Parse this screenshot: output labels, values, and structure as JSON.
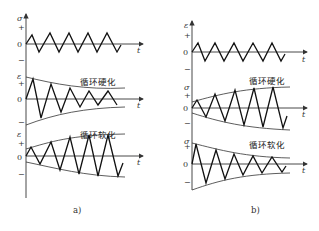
{
  "panels": [
    {
      "caption": "a)",
      "plots": [
        {
          "y_axis": "σ",
          "x_axis": "t",
          "plus": "+",
          "zero": "0",
          "minus": "−",
          "note": ""
        },
        {
          "y_axis": "ε",
          "x_axis": "t",
          "plus": "+",
          "zero": "0",
          "minus": "−",
          "note": "循环硬化"
        },
        {
          "y_axis": "ε",
          "x_axis": "t",
          "plus": "+",
          "zero": "0",
          "minus": "−",
          "note": "循环软化"
        }
      ]
    },
    {
      "caption": "b)",
      "plots": [
        {
          "y_axis": "ε",
          "x_axis": "t",
          "plus": "+",
          "zero": "0",
          "minus": "−",
          "note": ""
        },
        {
          "y_axis": "σ",
          "x_axis": "t",
          "plus": "+",
          "zero": "0",
          "minus": "−",
          "note": "循环硬化"
        },
        {
          "y_axis": "σ",
          "x_axis": "t",
          "plus": "+",
          "zero": "0",
          "minus": "−",
          "note": "循环软化"
        }
      ]
    }
  ]
}
